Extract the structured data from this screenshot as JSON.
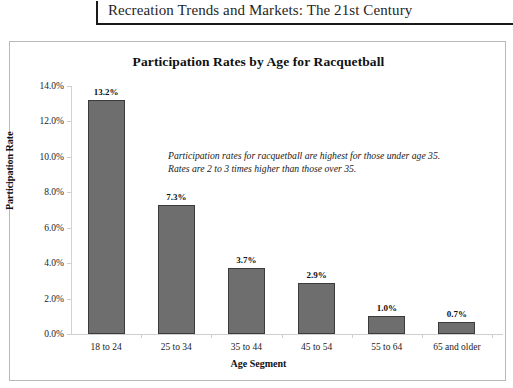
{
  "page_header": {
    "title": "Recreation Trends and Markets: The 21st Century"
  },
  "chart_data": {
    "type": "bar",
    "title": "Participation Rates by Age for Racquetball",
    "xlabel": "Age Segment",
    "ylabel": "Participation Rate",
    "categories": [
      "18 to 24",
      "25 to 34",
      "35 to 44",
      "45 to 54",
      "55 to 64",
      "65 and older"
    ],
    "values": [
      13.2,
      7.3,
      3.7,
      2.9,
      1.0,
      0.7
    ],
    "data_labels": [
      "13.2%",
      "7.3%",
      "3.7%",
      "2.9%",
      "1.0%",
      "0.7%"
    ],
    "ylim": [
      0,
      14
    ],
    "ytick_values": [
      0,
      2,
      4,
      6,
      8,
      10,
      12,
      14
    ],
    "ytick_labels": [
      "0.0%",
      "2.0%",
      "4.0%",
      "6.0%",
      "8.0%",
      "10.0%",
      "12.0%",
      "14.0%"
    ],
    "grid": false,
    "legend": "none",
    "bar_color": "#6e6e6e",
    "bar_border_color": "#3b3b3b",
    "annotation_line1": "Participation rates for racquetball are highest for those under age 35.",
    "annotation_line2": "Rates are 2 to 3 times higher than those over 35."
  }
}
